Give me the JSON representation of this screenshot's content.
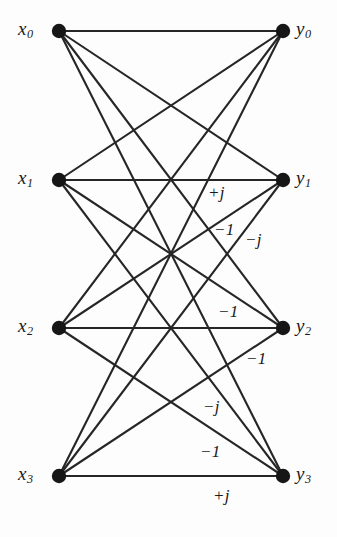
{
  "figure": {
    "width": 337,
    "height": 537,
    "background_color": "#fdfdfd",
    "ink_color": "#262626",
    "node_color": "#161616"
  },
  "nodes": {
    "left": [
      {
        "id": "x0",
        "label": "x",
        "sub": "0",
        "cx": 59,
        "cy": 31,
        "label_x": 18,
        "label_y": 19
      },
      {
        "id": "x1",
        "label": "x",
        "sub": "1",
        "cx": 59,
        "cy": 180,
        "label_x": 18,
        "label_y": 168
      },
      {
        "id": "x2",
        "label": "x",
        "sub": "2",
        "cx": 59,
        "cy": 328,
        "label_x": 18,
        "label_y": 316
      },
      {
        "id": "x3",
        "label": "x",
        "sub": "3",
        "cx": 59,
        "cy": 476,
        "label_x": 18,
        "label_y": 464
      }
    ],
    "right": [
      {
        "id": "y0",
        "label": "y",
        "sub": "0",
        "cx": 283,
        "cy": 31,
        "label_x": 296,
        "label_y": 19
      },
      {
        "id": "y1",
        "label": "y",
        "sub": "1",
        "cx": 283,
        "cy": 180,
        "label_x": 296,
        "label_y": 168
      },
      {
        "id": "y2",
        "label": "y",
        "sub": "2",
        "cx": 283,
        "cy": 328,
        "label_x": 296,
        "label_y": 316
      },
      {
        "id": "y3",
        "label": "y",
        "sub": "3",
        "cx": 283,
        "cy": 476,
        "label_x": 296,
        "label_y": 464
      }
    ],
    "radius": 7.2
  },
  "edges": [
    {
      "from": "x0",
      "to": "y0",
      "weight": ""
    },
    {
      "from": "x0",
      "to": "y1",
      "weight": ""
    },
    {
      "from": "x0",
      "to": "y2",
      "weight": ""
    },
    {
      "from": "x0",
      "to": "y3",
      "weight": ""
    },
    {
      "from": "x1",
      "to": "y0",
      "weight": ""
    },
    {
      "from": "x1",
      "to": "y1",
      "weight": "+j"
    },
    {
      "from": "x1",
      "to": "y2",
      "weight": "-1"
    },
    {
      "from": "x1",
      "to": "y3",
      "weight": "-j"
    },
    {
      "from": "x2",
      "to": "y0",
      "weight": ""
    },
    {
      "from": "x2",
      "to": "y1",
      "weight": "-1"
    },
    {
      "from": "x2",
      "to": "y2",
      "weight": ""
    },
    {
      "from": "x2",
      "to": "y3",
      "weight": "-1"
    },
    {
      "from": "x3",
      "to": "y0",
      "weight": ""
    },
    {
      "from": "x3",
      "to": "y1",
      "weight": "-j"
    },
    {
      "from": "x3",
      "to": "y2",
      "weight": "-1"
    },
    {
      "from": "x3",
      "to": "y3",
      "weight": "+j"
    }
  ],
  "edge_weight_labels": [
    {
      "id": "w-x1-y1",
      "text": "+j",
      "x": 208,
      "y": 184
    },
    {
      "id": "w-x1-y2",
      "text": "−1",
      "x": 214,
      "y": 221
    },
    {
      "id": "w-x1-y3",
      "text": "−j",
      "x": 245,
      "y": 231
    },
    {
      "id": "w-x2-y1",
      "text": "−1",
      "x": 218,
      "y": 303
    },
    {
      "id": "w-x2-y3",
      "text": "−1",
      "x": 246,
      "y": 350
    },
    {
      "id": "w-x3-y1",
      "text": "−j",
      "x": 203,
      "y": 398
    },
    {
      "id": "w-x3-y2",
      "text": "−1",
      "x": 200,
      "y": 443
    },
    {
      "id": "w-x3-y3",
      "text": "+j",
      "x": 213,
      "y": 487
    }
  ]
}
